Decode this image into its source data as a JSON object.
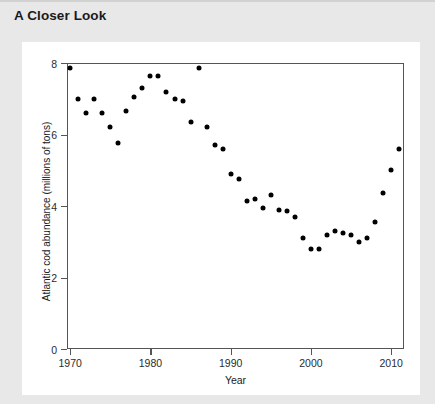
{
  "header": {
    "title": "A Closer Look"
  },
  "chart_data": {
    "type": "scatter",
    "title": "",
    "xlabel": "Year",
    "ylabel": "Atlantic cod abundance (millions of tons)",
    "xlim": [
      1969,
      1971
    ],
    "ylim": [
      0,
      8
    ],
    "xticks": [
      1970,
      1980,
      1990,
      2000,
      2010
    ],
    "yticks": [
      0,
      2,
      4,
      6,
      8
    ],
    "xtick_labels": [
      "1970",
      "1980",
      "1990",
      "2000",
      "2010"
    ],
    "ytick_labels": [
      "0",
      "2",
      "4",
      "6",
      "8"
    ],
    "grid": false,
    "legend": false,
    "marker": "circle",
    "marker_color": "#000000",
    "x": [
      1970,
      1971,
      1972,
      1973,
      1974,
      1975,
      1976,
      1977,
      1978,
      1979,
      1980,
      1981,
      1982,
      1983,
      1984,
      1985,
      1986,
      1987,
      1988,
      1989,
      1990,
      1991,
      1992,
      1993,
      1994,
      1995,
      1996,
      1997,
      1998,
      1999,
      2000,
      2001,
      2002,
      2003,
      2004,
      2005,
      2006,
      2007,
      2008,
      2009,
      2010,
      2011
    ],
    "y": [
      7.85,
      7.0,
      6.6,
      7.0,
      6.6,
      6.2,
      5.75,
      6.65,
      7.05,
      7.3,
      7.65,
      7.65,
      7.2,
      7.0,
      6.95,
      6.35,
      7.85,
      6.2,
      5.7,
      5.6,
      4.9,
      4.75,
      4.15,
      4.2,
      3.95,
      4.3,
      3.9,
      3.85,
      3.7,
      3.1,
      2.8,
      2.8,
      3.2,
      3.3,
      3.25,
      3.2,
      3.0,
      3.1,
      3.55,
      4.35,
      5.0,
      5.6,
      6.25
    ]
  },
  "axes": {
    "x_label": "Year",
    "y_label": "Atlantic cod abundance (millions of tons)"
  }
}
